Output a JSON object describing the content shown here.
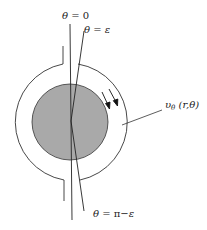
{
  "diagram": {
    "labels": {
      "theta_zero": {
        "theta": "θ",
        "rest": " = 0"
      },
      "theta_eps": {
        "theta": "θ",
        "rest": " = ",
        "eps": "ε"
      },
      "theta_pi_eps": {
        "theta": "θ",
        "rest": " = π−",
        "eps": "ε"
      },
      "velocity": {
        "upsilon": "υ",
        "sub": "θ",
        "args": " (r,θ)"
      }
    },
    "geometry": {
      "center": [
        70,
        122
      ],
      "inner_radius": 38,
      "outer_radius": 59
    },
    "colors": {
      "disk_fill": "#a9a9a9",
      "stroke": "#333333",
      "background": "#ffffff"
    }
  }
}
